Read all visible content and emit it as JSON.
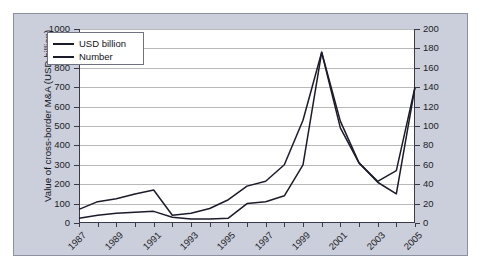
{
  "figure": {
    "background_color": "#cbcfdb",
    "plot_background_color": "#ffffff",
    "line_color": "#1b1b2a",
    "grid_color": "#b9b9b9"
  },
  "legend": {
    "position": "top-left-inside",
    "entries": [
      {
        "label": "USD billion",
        "color": "#1b1b2a"
      },
      {
        "label": "Number",
        "color": "#1b1b2a"
      }
    ]
  },
  "chart_data": {
    "type": "line",
    "title": "",
    "subtitle": "",
    "xlabel": "",
    "ylabel": "Value of cross-border M&A (USD billion)",
    "ylabel_secondary": "Number of transactions",
    "grid": true,
    "legend_position": "upper left",
    "xlim": [
      1987,
      2005
    ],
    "ylim": [
      0,
      1000
    ],
    "ylim_secondary": [
      0,
      200
    ],
    "yticks": [
      0,
      100,
      200,
      300,
      400,
      500,
      600,
      700,
      800,
      900,
      1000
    ],
    "yticks_secondary": [
      0,
      20,
      40,
      60,
      80,
      100,
      120,
      140,
      160,
      180,
      200
    ],
    "x": [
      1987,
      1988,
      1989,
      1990,
      1991,
      1992,
      1993,
      1994,
      1995,
      1996,
      1997,
      1998,
      1999,
      2000,
      2001,
      2002,
      2003,
      2004,
      2005
    ],
    "xtick_labels": [
      "1987",
      "1989",
      "1991",
      "1993",
      "1995",
      "1997",
      "1999",
      "2001",
      "2003",
      "2005"
    ],
    "xtick_label_years": [
      1987,
      1989,
      1991,
      1993,
      1995,
      1997,
      1999,
      2001,
      2003,
      2005
    ],
    "series": [
      {
        "name": "USD billion",
        "axis": "left",
        "values": [
          70,
          110,
          125,
          150,
          170,
          40,
          50,
          75,
          120,
          190,
          215,
          300,
          530,
          880,
          490,
          310,
          215,
          270,
          700
        ]
      },
      {
        "name": "Number",
        "axis": "right",
        "values": [
          5,
          8,
          10,
          11,
          12,
          6,
          4,
          4,
          5,
          20,
          22,
          28,
          60,
          176,
          105,
          62,
          42,
          30,
          140
        ]
      }
    ]
  }
}
